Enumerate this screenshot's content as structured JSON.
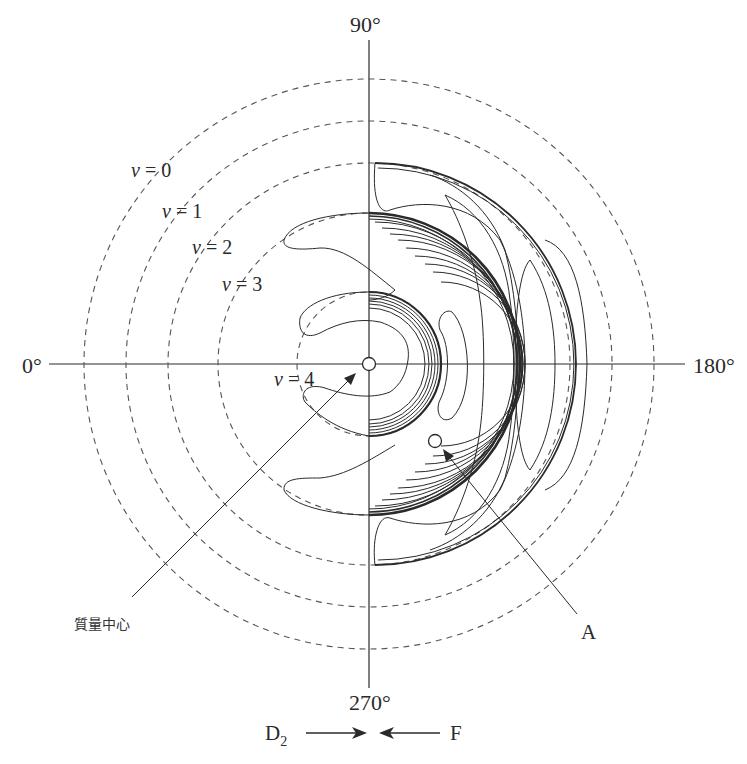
{
  "figure": {
    "type": "polar contour diagram",
    "center_px": [
      369,
      364
    ],
    "angle_labels": {
      "top": "90°",
      "left": "0°",
      "right": "180°",
      "bottom": "270°"
    },
    "vibrational_levels": [
      {
        "symbol": "v",
        "eq": "=",
        "value": "0",
        "radius_px": 285
      },
      {
        "symbol": "v",
        "eq": "=",
        "value": "1",
        "radius_px": 243
      },
      {
        "symbol": "v",
        "eq": "=",
        "value": "2",
        "radius_px": 201
      },
      {
        "symbol": "v",
        "eq": "=",
        "value": "3",
        "radius_px": 151
      },
      {
        "symbol": "v",
        "eq": "=",
        "value": "4",
        "radius_px": 72
      }
    ],
    "annotations": {
      "center_of_mass": "質量中心",
      "point_a": "A"
    },
    "beams": {
      "left_species": "D",
      "left_subscript": "2",
      "right_species": "F"
    },
    "colors": {
      "ink": "#2a2a2a",
      "background": "#ffffff"
    }
  }
}
